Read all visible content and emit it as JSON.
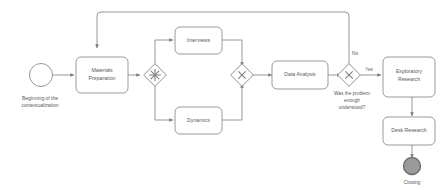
{
  "diagram": {
    "colors": {
      "stroke": "#8c8c8c",
      "task_stroke": "#8f8f8f",
      "task_fill": "#ffffff",
      "text": "#5a5a5a",
      "end_event_fill": "#9a9a9a",
      "end_event_stroke": "#6e6e6e",
      "background": "#ffffff"
    },
    "events": [
      {
        "id": "start",
        "type": "start-event",
        "shape": "circle",
        "label": "Beginning of the contextualization",
        "label_lines": [
          "Beginning of the",
          "contextualization"
        ]
      },
      {
        "id": "end",
        "type": "end-event",
        "shape": "filled-circle",
        "label": "Closing",
        "label_lines": [
          "Closing"
        ]
      }
    ],
    "tasks": [
      {
        "id": "materials-preparation",
        "label": "Materials Preparation",
        "label_lines": [
          "Materials",
          "Preparation"
        ]
      },
      {
        "id": "interviews",
        "label": "Interviews",
        "label_lines": [
          "Interviews"
        ]
      },
      {
        "id": "dynamics",
        "label": "Dynamics",
        "label_lines": [
          "Dynamics"
        ]
      },
      {
        "id": "data-analysis",
        "label": "Data Analysis",
        "label_lines": [
          "Data Analysis"
        ]
      },
      {
        "id": "exploratory-research",
        "label": "Exploratory Research",
        "label_lines": [
          "Exploratory",
          "Research"
        ]
      },
      {
        "id": "desk-research",
        "label": "Desk Research",
        "label_lines": [
          "Desk Research"
        ]
      }
    ],
    "gateways": [
      {
        "id": "parallel-split",
        "type": "complex-gateway",
        "marker": "asterisk",
        "label": ""
      },
      {
        "id": "exclusive-merge",
        "type": "exclusive-gateway",
        "marker": "x",
        "label": ""
      },
      {
        "id": "decision",
        "type": "exclusive-gateway",
        "marker": "x",
        "label": "Was the problem enough understood?",
        "label_lines": [
          "Was the problem",
          "enough",
          "understood?"
        ]
      }
    ],
    "flow_labels": {
      "no": "No",
      "yes": "Yes"
    }
  }
}
